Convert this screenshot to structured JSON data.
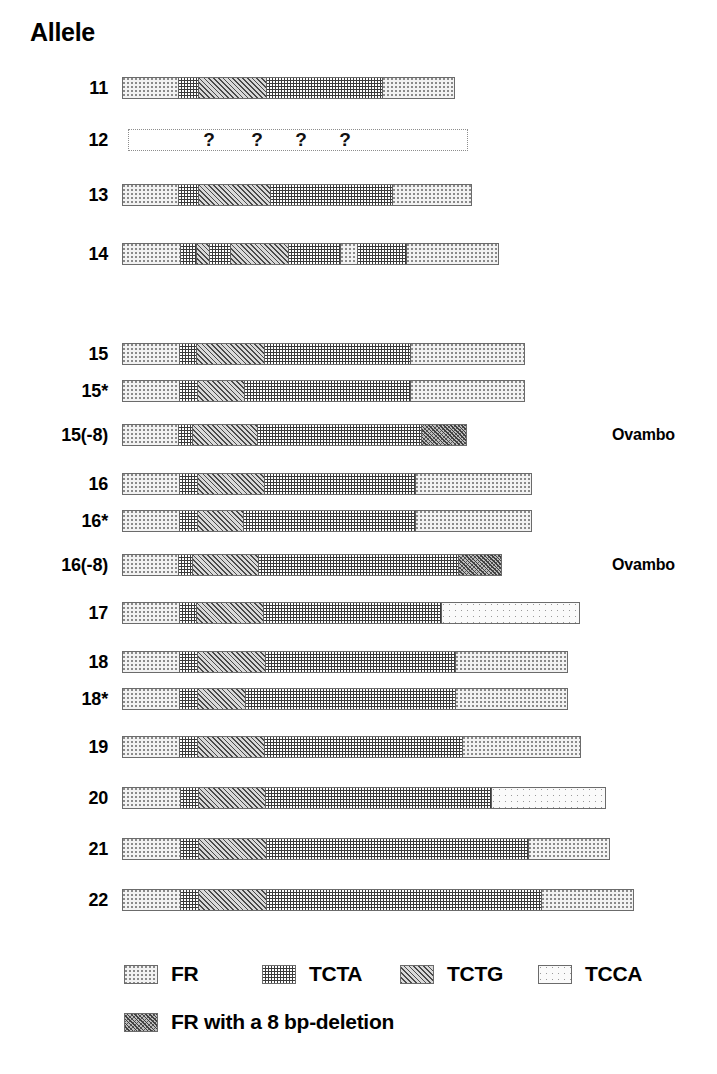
{
  "title": "Allele",
  "chart_data": {
    "type": "table",
    "title": "Allele",
    "xlabel": "",
    "ylabel": "",
    "pattern_types": [
      "FR",
      "TCTA",
      "TCTG",
      "TCCA",
      "DEL"
    ],
    "unit_px": 1,
    "bar_origin_px": 122,
    "categories": [
      "11",
      "12",
      "13",
      "14",
      "15",
      "15*",
      "15(-8)",
      "16",
      "16*",
      "16(-8)",
      "17",
      "18",
      "18*",
      "19",
      "20",
      "21",
      "22"
    ],
    "rows": [
      {
        "label": "11",
        "note": "",
        "unknown": false,
        "bar_left": 122,
        "bar_width": 333,
        "segments": [
          {
            "type": "FR",
            "width": 55
          },
          {
            "type": "TCTA",
            "width": 20
          },
          {
            "type": "TCTG",
            "width": 68
          },
          {
            "type": "TCTA",
            "width": 116
          },
          {
            "type": "FR",
            "width": 74
          }
        ]
      },
      {
        "label": "12",
        "note": "",
        "unknown": true,
        "bar_left": 128,
        "bar_width": 340,
        "qmark_positions": [
          80,
          128,
          172,
          216
        ],
        "qmark_text": "?",
        "segments": []
      },
      {
        "label": "13",
        "note": "",
        "unknown": false,
        "bar_left": 122,
        "bar_width": 350,
        "segments": [
          {
            "type": "FR",
            "width": 55
          },
          {
            "type": "TCTA",
            "width": 20
          },
          {
            "type": "TCTG",
            "width": 72
          },
          {
            "type": "TCTA",
            "width": 122
          },
          {
            "type": "FR",
            "width": 81
          }
        ]
      },
      {
        "label": "14",
        "note": "",
        "unknown": false,
        "bar_left": 122,
        "bar_width": 377,
        "segments": [
          {
            "type": "FR",
            "width": 57
          },
          {
            "type": "TCTA",
            "width": 16
          },
          {
            "type": "TCTG",
            "width": 13
          },
          {
            "type": "TCTA",
            "width": 21
          },
          {
            "type": "TCTG",
            "width": 58
          },
          {
            "type": "TCTA",
            "width": 52
          },
          {
            "type": "FR",
            "width": 17
          },
          {
            "type": "TCTA",
            "width": 49
          },
          {
            "type": "FR",
            "width": 94
          }
        ]
      },
      {
        "label": "15",
        "note": "",
        "unknown": false,
        "bar_left": 122,
        "bar_width": 403,
        "segments": [
          {
            "type": "FR",
            "width": 56
          },
          {
            "type": "TCTA",
            "width": 17
          },
          {
            "type": "TCTG",
            "width": 68
          },
          {
            "type": "TCTA",
            "width": 146
          },
          {
            "type": "FR",
            "width": 116
          }
        ]
      },
      {
        "label": "15*",
        "note": "",
        "unknown": false,
        "bar_left": 122,
        "bar_width": 403,
        "segments": [
          {
            "type": "FR",
            "width": 56
          },
          {
            "type": "TCTA",
            "width": 18
          },
          {
            "type": "TCTG",
            "width": 47
          },
          {
            "type": "TCTA",
            "width": 166
          },
          {
            "type": "FR",
            "width": 116
          }
        ]
      },
      {
        "label": "15(-8)",
        "note": "Ovambo",
        "unknown": false,
        "bar_left": 122,
        "bar_width": 345,
        "segments": [
          {
            "type": "FR",
            "width": 55
          },
          {
            "type": "TCTA",
            "width": 14
          },
          {
            "type": "TCTG",
            "width": 65
          },
          {
            "type": "TCTA",
            "width": 164
          },
          {
            "type": "DEL",
            "width": 47
          }
        ]
      },
      {
        "label": "16",
        "note": "",
        "unknown": false,
        "bar_left": 122,
        "bar_width": 410,
        "segments": [
          {
            "type": "FR",
            "width": 56
          },
          {
            "type": "TCTA",
            "width": 18
          },
          {
            "type": "TCTG",
            "width": 67
          },
          {
            "type": "TCTA",
            "width": 151
          },
          {
            "type": "FR",
            "width": 118
          }
        ]
      },
      {
        "label": "16*",
        "note": "",
        "unknown": false,
        "bar_left": 122,
        "bar_width": 410,
        "segments": [
          {
            "type": "FR",
            "width": 56
          },
          {
            "type": "TCTA",
            "width": 18
          },
          {
            "type": "TCTG",
            "width": 46
          },
          {
            "type": "TCTA",
            "width": 172
          },
          {
            "type": "FR",
            "width": 118
          }
        ]
      },
      {
        "label": "16(-8)",
        "note": "Ovambo",
        "unknown": false,
        "bar_left": 122,
        "bar_width": 380,
        "segments": [
          {
            "type": "FR",
            "width": 55
          },
          {
            "type": "TCTA",
            "width": 14
          },
          {
            "type": "TCTG",
            "width": 66
          },
          {
            "type": "TCTA",
            "width": 200
          },
          {
            "type": "DEL",
            "width": 45
          }
        ]
      },
      {
        "label": "17",
        "note": "",
        "unknown": false,
        "bar_left": 122,
        "bar_width": 458,
        "segments": [
          {
            "type": "FR",
            "width": 56
          },
          {
            "type": "TCTA",
            "width": 17
          },
          {
            "type": "TCTG",
            "width": 67
          },
          {
            "type": "TCTA",
            "width": 178
          },
          {
            "type": "TCCA",
            "width": 140
          }
        ]
      },
      {
        "label": "18",
        "note": "",
        "unknown": false,
        "bar_left": 122,
        "bar_width": 446,
        "segments": [
          {
            "type": "FR",
            "width": 56
          },
          {
            "type": "TCTA",
            "width": 18
          },
          {
            "type": "TCTG",
            "width": 68
          },
          {
            "type": "TCTA",
            "width": 190
          },
          {
            "type": "FR",
            "width": 114
          }
        ]
      },
      {
        "label": "18*",
        "note": "",
        "unknown": false,
        "bar_left": 122,
        "bar_width": 446,
        "segments": [
          {
            "type": "FR",
            "width": 56
          },
          {
            "type": "TCTA",
            "width": 18
          },
          {
            "type": "TCTG",
            "width": 48
          },
          {
            "type": "TCTA",
            "width": 210
          },
          {
            "type": "FR",
            "width": 114
          }
        ]
      },
      {
        "label": "19",
        "note": "",
        "unknown": false,
        "bar_left": 122,
        "bar_width": 459,
        "segments": [
          {
            "type": "FR",
            "width": 56
          },
          {
            "type": "TCTA",
            "width": 18
          },
          {
            "type": "TCTG",
            "width": 67
          },
          {
            "type": "TCTA",
            "width": 198
          },
          {
            "type": "FR",
            "width": 120
          }
        ]
      },
      {
        "label": "20",
        "note": "",
        "unknown": false,
        "bar_left": 122,
        "bar_width": 484,
        "segments": [
          {
            "type": "FR",
            "width": 57
          },
          {
            "type": "TCTA",
            "width": 18
          },
          {
            "type": "TCTG",
            "width": 67
          },
          {
            "type": "TCTA",
            "width": 226
          },
          {
            "type": "TCCA",
            "width": 116
          }
        ]
      },
      {
        "label": "21",
        "note": "",
        "unknown": false,
        "bar_left": 122,
        "bar_width": 488,
        "segments": [
          {
            "type": "FR",
            "width": 57
          },
          {
            "type": "TCTA",
            "width": 18
          },
          {
            "type": "TCTG",
            "width": 68
          },
          {
            "type": "TCTA",
            "width": 262
          },
          {
            "type": "FR",
            "width": 83
          }
        ]
      },
      {
        "label": "22",
        "note": "",
        "unknown": false,
        "bar_left": 122,
        "bar_width": 512,
        "segments": [
          {
            "type": "FR",
            "width": 57
          },
          {
            "type": "TCTA",
            "width": 18
          },
          {
            "type": "TCTG",
            "width": 68
          },
          {
            "type": "TCTA",
            "width": 275
          },
          {
            "type": "FR",
            "width": 94
          }
        ]
      }
    ],
    "legend": {
      "row1": [
        {
          "pattern": "FR",
          "label": "FR",
          "x": 124
        },
        {
          "pattern": "TCTA",
          "label": "TCTA",
          "x": 262
        },
        {
          "pattern": "TCTG",
          "label": "TCTG",
          "x": 400
        },
        {
          "pattern": "TCCA",
          "label": "TCCA",
          "x": 538
        }
      ],
      "row2": [
        {
          "pattern": "DEL",
          "label": "FR with a 8 bp-deletion",
          "x": 124
        }
      ]
    }
  }
}
